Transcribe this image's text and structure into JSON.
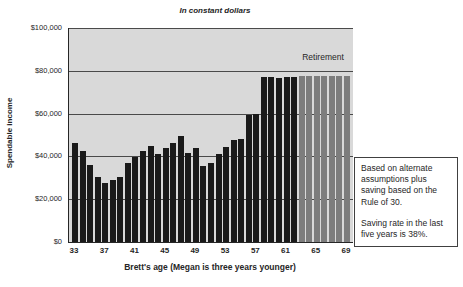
{
  "chart_data": {
    "type": "bar",
    "title": "In constant dollars",
    "ylabel": "Spendable income",
    "xlabel": "Brett's age (Megan is three years younger)",
    "retirement_label": "Retirement",
    "ylim": [
      0,
      100000
    ],
    "ytick_values": [
      0,
      20000,
      40000,
      60000,
      80000,
      100000
    ],
    "ytick_labels": [
      "$0",
      "$20,000",
      "$40,000",
      "$60,000",
      "$80,000",
      "$100,000"
    ],
    "xtick_ages": [
      33,
      37,
      41,
      45,
      49,
      53,
      57,
      61,
      65,
      69
    ],
    "ages": [
      33,
      34,
      35,
      36,
      37,
      38,
      39,
      40,
      41,
      42,
      43,
      44,
      45,
      46,
      47,
      48,
      49,
      50,
      51,
      52,
      53,
      54,
      55,
      56,
      57,
      58,
      59,
      60,
      61,
      62,
      63,
      64,
      65,
      66,
      67,
      68,
      69
    ],
    "values": [
      46500,
      42500,
      36000,
      30500,
      27500,
      29000,
      30500,
      37000,
      39500,
      42500,
      45000,
      41000,
      44000,
      46500,
      49500,
      41500,
      44000,
      35500,
      37000,
      41000,
      44500,
      47500,
      48000,
      59500,
      60000,
      77000,
      77000,
      76500,
      77000,
      77000,
      77500,
      77500,
      77500,
      77500,
      77500,
      77500,
      77500
    ],
    "retirement_start_age": 63,
    "grid": "horizontal",
    "legend_position": "none",
    "colors": {
      "working_bar": "#1a1a1a",
      "retirement_bar": "#7d7d7d",
      "plot_bg": "#d9d9d9",
      "gridline": "#4a4a4a"
    }
  },
  "annotation_box": {
    "para1": "Based on alternate assumptions plus saving based on the Rule of 30.",
    "para2": "Saving rate in the last five years is 38%."
  }
}
